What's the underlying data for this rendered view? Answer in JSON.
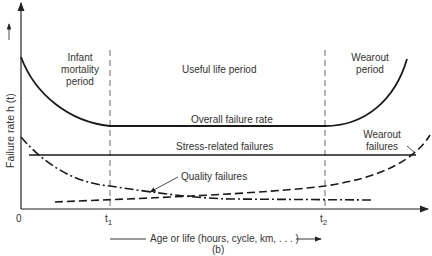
{
  "diagram": {
    "type": "bathtub-curve",
    "caption": "(b)",
    "y_axis_label": "Failure rate h (t)",
    "x_axis_label": "Age or life (hours, cycle, km, . . . )",
    "x_ticks": {
      "origin": "0",
      "t1": "t",
      "t1_sub": "1",
      "t2": "t",
      "t2_sub": "2"
    },
    "regions": {
      "infant": [
        "Infant",
        "mortality",
        "period"
      ],
      "useful": "Useful life period",
      "wearout": [
        "Wearout",
        "period"
      ]
    },
    "curves": {
      "overall": "Overall failure rate",
      "stress": "Stress-related failures",
      "quality": "Quality failures",
      "wearout": [
        "Wearout",
        "failures"
      ]
    },
    "colors": {
      "line": "#1a1a1a",
      "text": "#333333",
      "background": "#ffffff"
    }
  }
}
